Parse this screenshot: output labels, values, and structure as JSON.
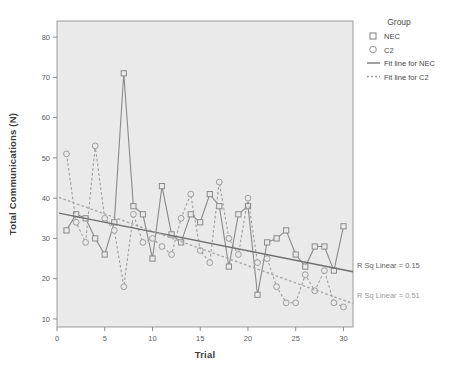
{
  "chart_data": {
    "type": "line",
    "title": "",
    "xlabel": "Trial",
    "ylabel": "Total Communications (N)",
    "xlim": [
      0,
      31
    ],
    "ylim": [
      8,
      84
    ],
    "xticks": [
      0,
      5,
      10,
      15,
      20,
      25,
      30
    ],
    "yticks": [
      10,
      20,
      30,
      40,
      50,
      60,
      70,
      80
    ],
    "grid": false,
    "legend_position": "top-right",
    "plot_bg": "#eaeaea",
    "series": [
      {
        "name": "NEC",
        "marker": "square",
        "line_style": "solid",
        "color": "#8a8a8a",
        "x": [
          1,
          2,
          3,
          4,
          5,
          6,
          7,
          8,
          9,
          10,
          11,
          12,
          13,
          14,
          15,
          16,
          17,
          18,
          19,
          20,
          21,
          22,
          23,
          24,
          25,
          26,
          27,
          28,
          29,
          30
        ],
        "values": [
          32,
          36,
          35,
          30,
          26,
          34,
          71,
          38,
          36,
          25,
          43,
          31,
          29,
          36,
          34,
          41,
          38,
          23,
          36,
          38,
          16,
          29,
          30,
          32,
          26,
          23,
          28,
          28,
          22,
          33
        ]
      },
      {
        "name": "C2",
        "marker": "circle",
        "line_style": "dashed",
        "color": "#9d9d9d",
        "x": [
          1,
          2,
          3,
          4,
          5,
          6,
          7,
          8,
          9,
          10,
          11,
          12,
          13,
          14,
          15,
          16,
          17,
          18,
          19,
          20,
          21,
          22,
          23,
          24,
          25,
          26,
          27,
          28,
          29,
          30
        ],
        "values": [
          51,
          34,
          29,
          53,
          35,
          32,
          18,
          36,
          29,
          30,
          28,
          26,
          35,
          41,
          27,
          24,
          44,
          30,
          26,
          40,
          24,
          25,
          18,
          14,
          14,
          21,
          17,
          22,
          14,
          13
        ]
      }
    ],
    "fits": [
      {
        "name": "Fit line for NEC",
        "line_style": "solid",
        "color": "#6f6f6f",
        "x_start": 0.2,
        "y_start": 36.3,
        "x_end": 31.0,
        "y_end": 21.7,
        "r_sq_label": "R Sq Linear =  0.15",
        "r_sq_value": 0.15
      },
      {
        "name": "Fit line for C2",
        "line_style": "dashed",
        "color": "#a7a7a7",
        "x_start": 0.2,
        "y_start": 40.2,
        "x_end": 31.0,
        "y_end": 13.8,
        "r_sq_label": "R Sq Linear =  0.51",
        "r_sq_value": 0.51
      }
    ]
  },
  "legend": {
    "title": "Group",
    "items": [
      {
        "label": "NEC",
        "glyph": "square-marker-icon"
      },
      {
        "label": "C2",
        "glyph": "circle-marker-icon"
      },
      {
        "label": "Fit line for NEC",
        "glyph": "solid-line-icon"
      },
      {
        "label": "Fit line for C2",
        "glyph": "dashed-line-icon"
      }
    ]
  },
  "axes": {
    "x_title": "Trial",
    "y_title": "Total Communications (N)",
    "x_tick_labels": [
      "0",
      "5",
      "10",
      "15",
      "20",
      "25",
      "30"
    ],
    "y_tick_labels": [
      "10",
      "20",
      "30",
      "40",
      "50",
      "60",
      "70",
      "80"
    ]
  },
  "annotations": {
    "nec_rsq": "R Sq Linear =  0.15",
    "c2_rsq": "R Sq Linear =  0.51"
  }
}
